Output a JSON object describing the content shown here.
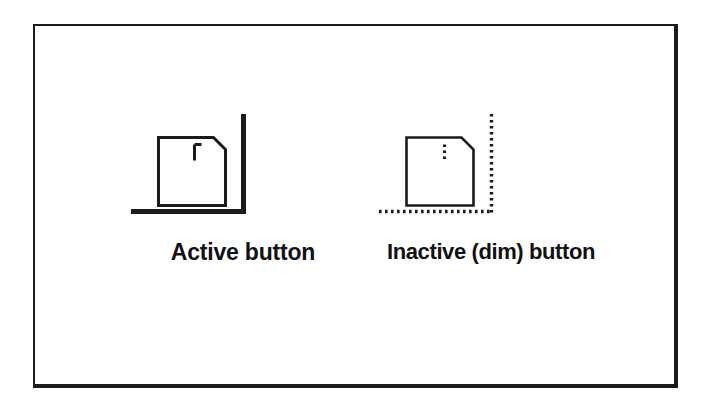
{
  "figure": {
    "background_color": "#ffffff",
    "frame_color": "#1b1b1b",
    "ink_color": "#1b1b1b",
    "items": [
      {
        "id": "active",
        "caption": "Active button",
        "state": "active",
        "icon_name": "card-icon-solid",
        "guide_style": "solid",
        "mark_style": "solid"
      },
      {
        "id": "inactive",
        "caption": "Inactive (dim) button",
        "state": "inactive",
        "icon_name": "card-icon-dotted",
        "guide_style": "dotted",
        "mark_style": "dotted"
      }
    ]
  }
}
